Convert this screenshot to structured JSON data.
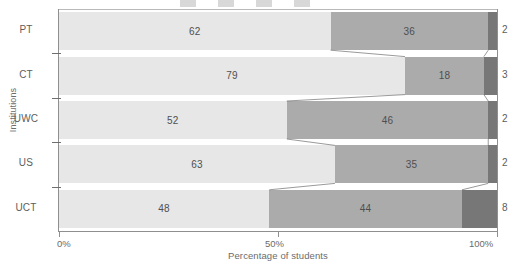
{
  "chart_data": {
    "type": "bar",
    "orientation": "horizontal",
    "stacked": true,
    "stack_mode": "percent",
    "title": "",
    "xlabel": "Percentage of students",
    "ylabel": "Institutions",
    "xlim": [
      0,
      100
    ],
    "xticks": [
      0,
      50,
      100
    ],
    "xticklabels": [
      "0%",
      "50%",
      "100%"
    ],
    "grid": false,
    "legend": "top (cropped out of view)",
    "categories": [
      "PT",
      "CT",
      "UWC",
      "US",
      "UCT"
    ],
    "series": [
      {
        "name": "series-1",
        "color": "#e7e7e7",
        "values": [
          62,
          79,
          52,
          63,
          48
        ]
      },
      {
        "name": "series-2",
        "color": "#ababab",
        "values": [
          36,
          18,
          46,
          35,
          44
        ]
      },
      {
        "name": "series-3",
        "color": "#777777",
        "values": [
          2,
          3,
          2,
          2,
          8
        ]
      }
    ],
    "value_labels_inside": [
      [
        "62",
        "36"
      ],
      [
        "79",
        "18"
      ],
      [
        "52",
        "46"
      ],
      [
        "63",
        "35"
      ],
      [
        "48",
        "44"
      ]
    ],
    "value_labels_outside": [
      "2",
      "3",
      "2",
      "2",
      "8"
    ]
  },
  "axes": {
    "y_title": "Institutions",
    "x_title": "Percentage of students",
    "x_tick_labels": [
      "0%",
      "50%",
      "100%"
    ],
    "y_tick_labels": [
      "PT",
      "CT",
      "UWC",
      "US",
      "UCT"
    ]
  },
  "colors": {
    "series_1": "#e7e7e7",
    "series_2": "#ababab",
    "series_3": "#777777",
    "axis": "#8f8f8f",
    "text": "#6b6b6b"
  }
}
